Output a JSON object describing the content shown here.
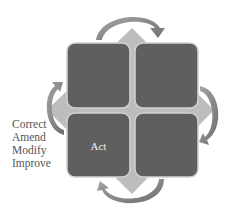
{
  "diagram": {
    "type": "PDCA cycle quadrant diagram",
    "quadrants": [
      {
        "position": "top-left",
        "label": ""
      },
      {
        "position": "top-right",
        "label": ""
      },
      {
        "position": "bottom-left",
        "label": "Act"
      },
      {
        "position": "bottom-right",
        "label": ""
      }
    ],
    "side_labels": [
      "Correct",
      "Amend",
      "Modify",
      "Improve"
    ],
    "colors": {
      "quadrant_fill": "#5f5f5f",
      "quadrant_border": "#cfcfcf",
      "diamond_fill": "#bdbdbd",
      "arrow_fill": "#8a8a8a",
      "label_text": "#555555",
      "quadrant_text": "#f0f0f0"
    },
    "arrows": [
      {
        "from": "top-left",
        "to": "top-right",
        "direction": "clockwise"
      },
      {
        "from": "top-right",
        "to": "bottom-right",
        "direction": "clockwise"
      },
      {
        "from": "bottom-right",
        "to": "bottom-left",
        "direction": "clockwise"
      },
      {
        "from": "bottom-left",
        "to": "top-left",
        "direction": "clockwise"
      }
    ]
  }
}
